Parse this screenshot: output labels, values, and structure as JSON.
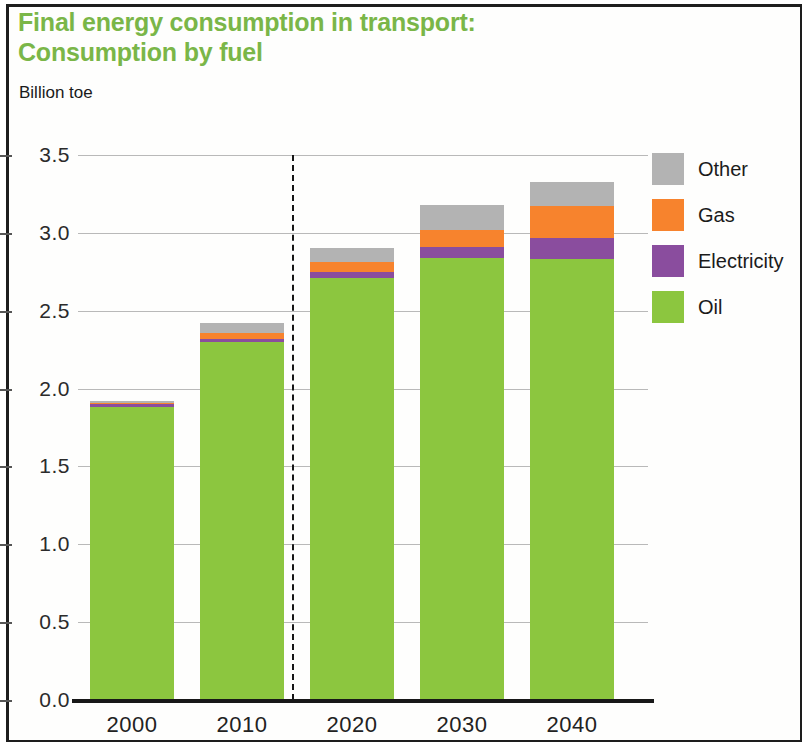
{
  "figure": {
    "title": "Final energy consumption in transport:\nConsumption by fuel",
    "subtitle": "Billion toe"
  },
  "chart_data": {
    "type": "bar",
    "stacked": true,
    "title": "Final energy consumption in transport: Consumption by fuel",
    "subtitle": "Billion toe",
    "xlabel": "",
    "ylabel": "Billion toe",
    "categories": [
      "2000",
      "2010",
      "2020",
      "2030",
      "2040"
    ],
    "ylim": [
      0.0,
      3.5
    ],
    "yticks": [
      "0.0",
      "0.5",
      "1.0",
      "1.5",
      "2.0",
      "2.5",
      "3.0",
      "3.5"
    ],
    "ytick_values": [
      0.0,
      0.5,
      1.0,
      1.5,
      2.0,
      2.5,
      3.0,
      3.5
    ],
    "grid": true,
    "legend_position": "right",
    "series": [
      {
        "name": "Oil",
        "color": "#8cc63f",
        "values": [
          1.88,
          2.3,
          2.71,
          2.84,
          2.83
        ]
      },
      {
        "name": "Electricity",
        "color": "#8a4d9e",
        "values": [
          0.02,
          0.02,
          0.04,
          0.07,
          0.14
        ]
      },
      {
        "name": "Gas",
        "color": "#f7832d",
        "values": [
          0.01,
          0.04,
          0.06,
          0.11,
          0.2
        ]
      },
      {
        "name": "Other",
        "color": "#b3b3b3",
        "values": [
          0.01,
          0.06,
          0.09,
          0.16,
          0.16
        ]
      }
    ],
    "totals": [
      1.92,
      2.42,
      2.9,
      3.18,
      3.33
    ],
    "annotations": [
      {
        "type": "vertical-dashed-line",
        "between": [
          "2010",
          "2020"
        ],
        "label": "history / projection divider"
      }
    ]
  },
  "legend": {
    "items": [
      {
        "label": "Other",
        "color": "#b3b3b3"
      },
      {
        "label": "Gas",
        "color": "#f7832d"
      },
      {
        "label": "Electricity",
        "color": "#8a4d9e"
      },
      {
        "label": "Oil",
        "color": "#8cc63f"
      }
    ]
  }
}
